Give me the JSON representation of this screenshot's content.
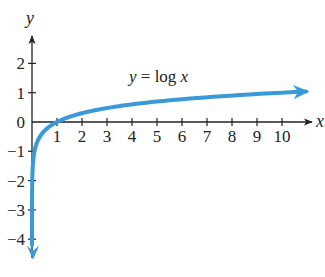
{
  "chart_data": {
    "type": "line",
    "title": "",
    "function": "y = log x",
    "annotation": {
      "text_prefix": "y",
      "text_eq": " = log ",
      "text_var": "x"
    },
    "xlabel": "x",
    "ylabel": "y",
    "xlim": [
      0,
      11.2
    ],
    "ylim": [
      -4.7,
      2.8
    ],
    "x_ticks": [
      1,
      2,
      3,
      4,
      5,
      6,
      7,
      8,
      9,
      10
    ],
    "y_ticks": [
      2,
      1,
      0,
      -1,
      -2,
      -3,
      -4
    ],
    "x_tick_labels": [
      "1",
      "2",
      "3",
      "4",
      "5",
      "6",
      "7",
      "8",
      "9",
      "10"
    ],
    "y_tick_labels": [
      "2",
      "1",
      "0",
      "−1",
      "−2",
      "−3",
      "−4"
    ],
    "grid": false,
    "series": [
      {
        "name": "y = log x",
        "color": "#3a9ad9",
        "points": [
          [
            2e-05,
            -4.7
          ],
          [
            0.0001,
            -4.0
          ],
          [
            0.001,
            -3.0
          ],
          [
            0.01,
            -2.0
          ],
          [
            0.1,
            -1.0
          ],
          [
            0.3,
            -0.52
          ],
          [
            0.5,
            -0.3
          ],
          [
            1,
            0
          ],
          [
            2,
            0.3
          ],
          [
            3,
            0.48
          ],
          [
            4,
            0.6
          ],
          [
            5,
            0.7
          ],
          [
            6,
            0.78
          ],
          [
            7,
            0.85
          ],
          [
            8,
            0.9
          ],
          [
            9,
            0.95
          ],
          [
            10,
            1.0
          ],
          [
            11.1,
            1.05
          ]
        ]
      }
    ]
  },
  "colors": {
    "curve": "#3a9ad9",
    "axis": "#222222"
  }
}
